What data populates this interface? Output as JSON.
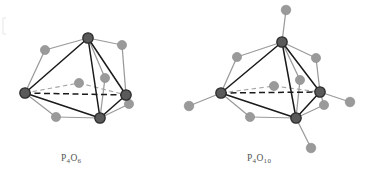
{
  "figure": {
    "background": "#ffffff",
    "width": 368,
    "height": 182
  },
  "colors": {
    "phosphorus_fill": "#5a5a5a",
    "phosphorus_stroke": "#2b2b2b",
    "oxygen_fill": "#9a9a9a",
    "oxygen_stroke": "#8a8a8a",
    "cage_bond": "#1a1a1a",
    "oxygen_bond": "#9a9a9a",
    "dashed_dark": "#1a1a1a",
    "dashed_light": "#a5a5a5",
    "caption_text": "#555555",
    "edge_artifact": "#dcdcdc"
  },
  "atoms": {
    "phosphorus_label": "P",
    "oxygen_label": "O",
    "phosphorus_radius": 5.2,
    "oxygen_radius": 4.6
  },
  "molecules": [
    {
      "id": "p4o6",
      "name": "P4O6",
      "formula_element_1": "P",
      "formula_sub_1": "4",
      "formula_element_2": "O",
      "formula_sub_2": "6",
      "caption": "P4O6",
      "phosphorus_count": 4,
      "oxygen_count": 6,
      "terminal_oxygen_count": 0,
      "bridging_oxygen_count": 6,
      "center_x": 80,
      "center_y": 80,
      "phosphorus_atoms": [
        {
          "name": "P-top",
          "x": 88,
          "y": 38
        },
        {
          "name": "P-left",
          "x": 25,
          "y": 93
        },
        {
          "name": "P-right",
          "x": 126,
          "y": 95
        },
        {
          "name": "P-front",
          "x": 100,
          "y": 118
        }
      ],
      "bridging_oxygen_atoms": [
        {
          "name": "O-top-left",
          "x": 45,
          "y": 50
        },
        {
          "name": "O-top-right",
          "x": 122,
          "y": 45
        },
        {
          "name": "O-center-back",
          "x": 79,
          "y": 83
        },
        {
          "name": "O-mid-right",
          "x": 105,
          "y": 78
        },
        {
          "name": "O-bottom-left",
          "x": 56,
          "y": 117
        },
        {
          "name": "O-low-right",
          "x": 129,
          "y": 104
        }
      ]
    },
    {
      "id": "p4o10",
      "name": "P4O10",
      "formula_element_1": "P",
      "formula_sub_1": "4",
      "formula_element_2": "O",
      "formula_sub_2": "10",
      "caption": "P4O10",
      "phosphorus_count": 4,
      "oxygen_count": 10,
      "terminal_oxygen_count": 4,
      "bridging_oxygen_count": 6,
      "center_x": 283,
      "center_y": 82,
      "phosphorus_atoms": [
        {
          "name": "P-top",
          "x": 282,
          "y": 42
        },
        {
          "name": "P-left",
          "x": 221,
          "y": 93
        },
        {
          "name": "P-right",
          "x": 320,
          "y": 92
        },
        {
          "name": "P-front",
          "x": 296,
          "y": 118
        }
      ],
      "bridging_oxygen_atoms": [
        {
          "name": "O-top-left",
          "x": 237,
          "y": 57
        },
        {
          "name": "O-top-right",
          "x": 316,
          "y": 58
        },
        {
          "name": "O-center-back",
          "x": 274,
          "y": 86
        },
        {
          "name": "O-mid-right",
          "x": 300,
          "y": 80
        },
        {
          "name": "O-bottom-left",
          "x": 250,
          "y": 117
        },
        {
          "name": "O-low-right",
          "x": 324,
          "y": 105
        }
      ],
      "terminal_oxygen_atoms": [
        {
          "name": "O-terminal-top",
          "x": 286,
          "y": 10
        },
        {
          "name": "O-terminal-left",
          "x": 189,
          "y": 106
        },
        {
          "name": "O-terminal-right",
          "x": 350,
          "y": 102
        },
        {
          "name": "O-terminal-bottom",
          "x": 311,
          "y": 148
        }
      ]
    }
  ]
}
